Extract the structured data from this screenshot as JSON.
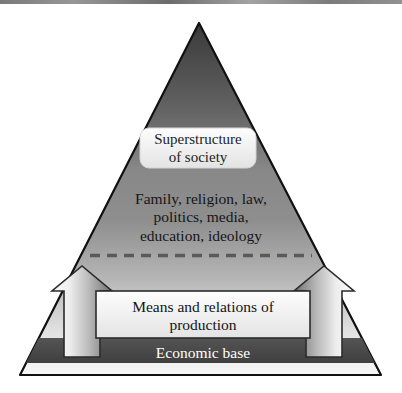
{
  "diagram": {
    "shape": "triangle",
    "colors": {
      "apex": "#3a3a3a",
      "mid": "#8a8a8a",
      "base_light": "#f2f2f2",
      "economic_band": "#4a4a4a",
      "outline": "#111111",
      "label_box_fill": "#f0f0f0",
      "arrow_light": "#f6f6f6",
      "arrow_dark": "#6f6f6f",
      "dashed_divider": "#5a5a5a",
      "text_dark": "#161616",
      "text_light": "#ffffff"
    },
    "layers": [
      {
        "id": "superstructure",
        "label_lines": [
          "Superstructure",
          "of society"
        ],
        "boxed": true
      },
      {
        "id": "institutions",
        "label_lines": [
          "Family, religion, law,",
          "politics, media,",
          "education, ideology"
        ],
        "boxed": false
      },
      {
        "id": "means-of-production",
        "label_lines": [
          "Means and relations of",
          "production"
        ],
        "boxed": true
      },
      {
        "id": "economic-base",
        "label_lines": [
          "Economic base"
        ],
        "boxed": false
      }
    ],
    "arrows": [
      {
        "id": "left-upward-arrow",
        "direction": "up"
      },
      {
        "id": "right-upward-arrow",
        "direction": "up"
      }
    ],
    "divider": {
      "id": "dashed-divider",
      "style": "dashed"
    }
  }
}
